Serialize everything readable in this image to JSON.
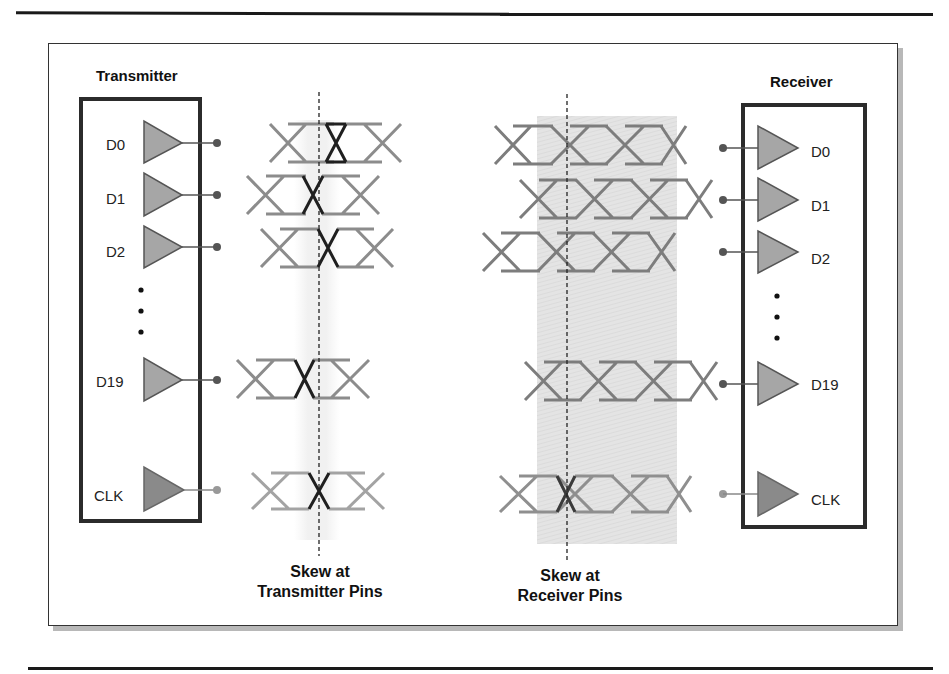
{
  "diagram": {
    "transmitter": {
      "title": "Transmitter",
      "pins": [
        {
          "label": "D0"
        },
        {
          "label": "D1"
        },
        {
          "label": "D2"
        },
        {
          "label": "D19"
        },
        {
          "label": "CLK"
        }
      ],
      "ellipsis": "⋮"
    },
    "receiver": {
      "title": "Receiver",
      "pins": [
        {
          "label": "D0"
        },
        {
          "label": "D1"
        },
        {
          "label": "D2"
        },
        {
          "label": "D19"
        },
        {
          "label": "CLK"
        }
      ],
      "ellipsis": "⋮"
    },
    "captions": {
      "tx_line1": "Skew at",
      "tx_line2": "Transmitter Pins",
      "rx_line1": "Skew at",
      "rx_line2": "Receiver Pins"
    },
    "colors": {
      "buffer_fill": "#a6a6a6",
      "clk_buffer_fill": "#8a8a8a",
      "eye_stroke": "#8c8c8c",
      "eye_highlight": "#1a1a1a",
      "skew_band": "#e3e3e3",
      "box_border": "#2b2b2b"
    }
  }
}
